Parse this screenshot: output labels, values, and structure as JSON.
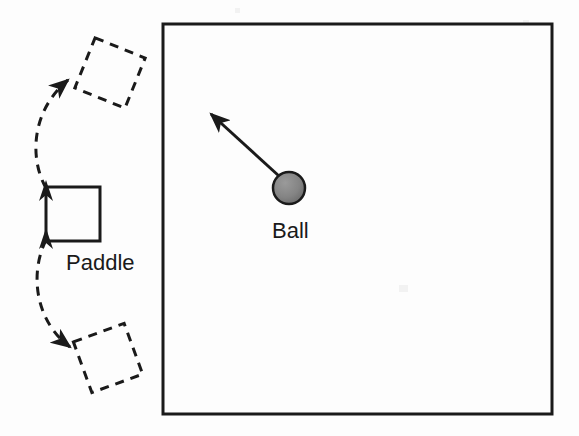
{
  "figure": {
    "background_color": "#fdfdfd",
    "stroke_color": "#1a1a1a",
    "canvas": {
      "width": 579,
      "height": 436
    }
  },
  "labels": {
    "paddle": "Paddle",
    "ball": "Ball"
  },
  "play_field": {
    "name": "play-field-border",
    "x": 163,
    "y": 24,
    "width": 389,
    "height": 390,
    "stroke_color": "#1a1a1a",
    "stroke_width": 3,
    "fill": "none"
  },
  "paddle": {
    "name": "paddle-square",
    "center_x": 73,
    "center_y": 214,
    "size": 54,
    "rotation_deg": 0,
    "stroke_color": "#1a1a1a",
    "stroke_width": 3,
    "style": "solid"
  },
  "ghost_paddles": [
    {
      "name": "ghost-paddle-upper",
      "center_x": 110,
      "center_y": 73,
      "size": 54,
      "rotation_deg": 22,
      "stroke_color": "#1a1a1a",
      "stroke_width": 3,
      "style": "dashed",
      "dash_pattern": "9 7"
    },
    {
      "name": "ghost-paddle-lower",
      "center_x": 108,
      "center_y": 358,
      "size": 54,
      "rotation_deg": -20,
      "stroke_color": "#1a1a1a",
      "stroke_width": 3,
      "style": "dashed",
      "dash_pattern": "9 7"
    }
  ],
  "rotation_arcs": [
    {
      "name": "rotation-arc-upward",
      "from_x": 46,
      "from_y": 188,
      "to_x": 70,
      "to_y": 78,
      "control_x": 28,
      "control_y": 128,
      "style": "dashed",
      "dash_pattern": "9 7",
      "arrowhead": "end",
      "stroke_width": 3
    },
    {
      "name": "rotation-arc-downward",
      "from_x": 46,
      "from_y": 240,
      "to_x": 72,
      "to_y": 348,
      "control_x": 28,
      "control_y": 300,
      "style": "dashed",
      "dash_pattern": "9 7",
      "arrowhead": "end",
      "stroke_width": 3
    }
  ],
  "paddle_edge_arrows": [
    {
      "name": "paddle-top-arrow",
      "x": 46,
      "y": 187,
      "direction": "up"
    },
    {
      "name": "paddle-bottom-arrow",
      "x": 46,
      "y": 241,
      "direction": "up"
    }
  ],
  "ball": {
    "name": "ball-circle",
    "center_x": 289,
    "center_y": 188,
    "radius": 16,
    "fill_color": "#808080",
    "stroke_color": "#1a1a1a",
    "stroke_width": 2.5
  },
  "velocity_arrow": {
    "name": "ball-velocity-arrow",
    "from_x": 279,
    "from_y": 176,
    "to_x": 207,
    "to_y": 110,
    "stroke_color": "#1a1a1a",
    "stroke_width": 3,
    "arrowhead": "end"
  },
  "label_positions": {
    "paddle": {
      "x": 66,
      "y": 270,
      "font_size": 22
    },
    "ball": {
      "x": 272,
      "y": 238,
      "font_size": 22
    }
  }
}
